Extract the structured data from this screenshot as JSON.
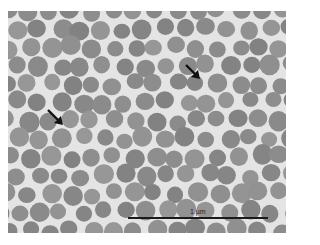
{
  "figure": {
    "background_color": "#e4e4e4",
    "particle_color": "#8a8a8a",
    "scale_bar": {
      "label": "1 µm"
    },
    "arrows": [
      {
        "name": "arrow-left",
        "tip_x": 62,
        "tip_y": 123
      },
      {
        "name": "arrow-right",
        "tip_x": 198,
        "tip_y": 77
      }
    ]
  }
}
